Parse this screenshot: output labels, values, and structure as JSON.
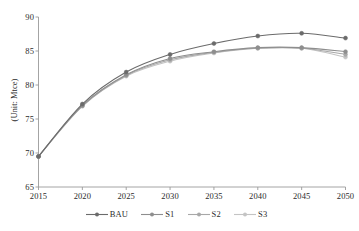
{
  "chart_data": {
    "type": "line",
    "title": "",
    "subtitle": "",
    "xlabel": "",
    "ylabel": "(Unit: Mtce)",
    "categories": [
      "2015",
      "2020",
      "2025",
      "2030",
      "2035",
      "2040",
      "2045",
      "2050"
    ],
    "x": [
      2015,
      2020,
      2025,
      2030,
      2035,
      2040,
      2045,
      2050
    ],
    "xlim": [
      2015,
      2050
    ],
    "ylim": [
      65,
      90
    ],
    "yticks": [
      65,
      70,
      75,
      80,
      85,
      90
    ],
    "xticks": [
      "2015",
      "2020",
      "2025",
      "2030",
      "2035",
      "2040",
      "2045",
      "2050"
    ],
    "grid": false,
    "legend_position": "bottom",
    "markers": "circle",
    "series": [
      {
        "name": "BAU",
        "color": "#6b6b6b",
        "values": [
          69.5,
          77.2,
          81.9,
          84.5,
          86.1,
          87.2,
          87.6,
          86.9
        ]
      },
      {
        "name": "S1",
        "color": "#8e8e8e",
        "values": [
          69.5,
          77.0,
          81.5,
          83.9,
          84.9,
          85.5,
          85.5,
          84.9
        ]
      },
      {
        "name": "S2",
        "color": "#a8a8a8",
        "values": [
          69.5,
          76.9,
          81.4,
          83.7,
          84.8,
          85.4,
          85.4,
          84.5
        ]
      },
      {
        "name": "S3",
        "color": "#c4c4c4",
        "values": [
          69.5,
          76.9,
          81.3,
          83.5,
          84.7,
          85.4,
          85.4,
          84.1
        ]
      }
    ]
  },
  "axis": {
    "y_title": "(Unit: Mtce)",
    "y_tick_labels": [
      "90",
      "85",
      "80",
      "75",
      "70",
      "65"
    ],
    "x_tick_labels": [
      "2015",
      "2020",
      "2025",
      "2030",
      "2035",
      "2040",
      "2045",
      "2050"
    ]
  },
  "legend": {
    "items": [
      {
        "label": "BAU",
        "color": "#6b6b6b"
      },
      {
        "label": "S1",
        "color": "#8e8e8e"
      },
      {
        "label": "S2",
        "color": "#a8a8a8"
      },
      {
        "label": "S3",
        "color": "#c4c4c4"
      }
    ]
  },
  "colors": {
    "axis_line": "#9a9a9a",
    "tick_text": "#2b2b2b",
    "background": "#ffffff"
  }
}
